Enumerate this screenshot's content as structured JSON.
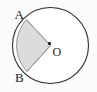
{
  "figure": {
    "type": "circle-sector-diagram",
    "canvas": {
      "width": 97,
      "height": 92,
      "background": "#fbfbfb"
    },
    "circle": {
      "center_x": 50.5,
      "center_y": 45.5,
      "radius": 38,
      "stroke_color": "#2b2b2b",
      "stroke_width": 1.1,
      "fill_color": "#ffffff"
    },
    "sector": {
      "fill_color": "#dcdcdc",
      "stroke_color": "#8c8c8c",
      "stroke_width": 0.9,
      "start_point": "A",
      "end_point": "B",
      "vertex": "O",
      "start_angle_deg": 215,
      "end_angle_deg": 145,
      "sweep_deg": 290,
      "direction": "counterclockwise-through-left"
    },
    "center_dot": {
      "x": 49.5,
      "y": 43.5,
      "size": 2.6,
      "color": "#000000"
    },
    "points": [
      {
        "id": "point-a",
        "label": "A",
        "x": 26.4,
        "y": 19.7,
        "label_x": 14.5,
        "label_y": 19.0
      },
      {
        "id": "point-b",
        "label": "B",
        "x": 27.0,
        "y": 71.5,
        "label_x": 15.0,
        "label_y": 82.0
      },
      {
        "id": "point-o",
        "label": "O",
        "x": 49.5,
        "y": 43.5,
        "label_x": 52.5,
        "label_y": 56.0
      }
    ],
    "radii": [
      {
        "id": "radius-oa",
        "from": "O",
        "to": "A"
      },
      {
        "id": "radius-ob",
        "from": "O",
        "to": "B"
      }
    ]
  }
}
